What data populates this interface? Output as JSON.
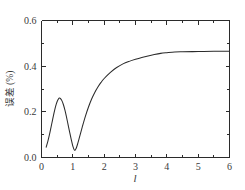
{
  "chart_data": {
    "type": "line",
    "title": "",
    "subtitle": "",
    "xlabel": "l",
    "ylabel": "误差 (%)",
    "xlim": [
      0,
      6
    ],
    "ylim": [
      0,
      0.6
    ],
    "grid": false,
    "legend": null,
    "legend_position": "none",
    "xticks": [
      0,
      1,
      2,
      3,
      4,
      5,
      6
    ],
    "xtick_labels": [
      "0",
      "1",
      "2",
      "3",
      "4",
      "5",
      "6"
    ],
    "xminor_ticks": [
      0.5,
      1.5,
      2.5,
      3.5,
      4.5,
      5.5
    ],
    "yticks": [
      0.0,
      0.2,
      0.4,
      0.6
    ],
    "ytick_labels": [
      "0.0",
      "0.2",
      "0.4",
      "0.6"
    ],
    "yminor_ticks": [
      0.1,
      0.3,
      0.5
    ],
    "line_color": "#2b2b2b",
    "background_color": "#ffffff",
    "axis_color": "#2b2b2b",
    "series": [
      {
        "name": "误差",
        "x": [
          0.15,
          0.2,
          0.25,
          0.3,
          0.35,
          0.4,
          0.45,
          0.5,
          0.55,
          0.57,
          0.6,
          0.65,
          0.7,
          0.75,
          0.8,
          0.85,
          0.9,
          0.95,
          1.0,
          1.05,
          1.1,
          1.15,
          1.2,
          1.3,
          1.4,
          1.5,
          1.6,
          1.7,
          1.8,
          1.9,
          2.0,
          2.2,
          2.4,
          2.6,
          2.8,
          3.0,
          3.2,
          3.4,
          3.6,
          3.8,
          4.0,
          4.25,
          4.5,
          5.0,
          5.5,
          6.0
        ],
        "values": [
          0.045,
          0.07,
          0.098,
          0.13,
          0.163,
          0.195,
          0.224,
          0.245,
          0.258,
          0.26,
          0.259,
          0.249,
          0.231,
          0.206,
          0.176,
          0.143,
          0.11,
          0.078,
          0.05,
          0.032,
          0.038,
          0.058,
          0.083,
          0.133,
          0.18,
          0.221,
          0.256,
          0.285,
          0.309,
          0.329,
          0.346,
          0.373,
          0.394,
          0.41,
          0.421,
          0.43,
          0.438,
          0.445,
          0.451,
          0.456,
          0.459,
          0.462,
          0.463,
          0.464,
          0.465,
          0.465
        ]
      }
    ],
    "annotations": [
      {
        "label": "local maximum",
        "x": 0.57,
        "y": 0.26
      },
      {
        "label": "local minimum",
        "x": 1.05,
        "y": 0.032
      },
      {
        "label": "plateau",
        "x": 6.0,
        "y": 0.465
      }
    ]
  }
}
